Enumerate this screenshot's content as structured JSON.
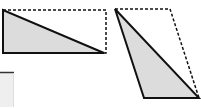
{
  "diagram": {
    "colors": {
      "fill": "#dcdcdc",
      "stroke": "#111111",
      "background": "#ffffff"
    },
    "figures": [
      {
        "name": "rectangle-with-triangle",
        "dashed_shape": "rectangle",
        "dashed_points": [
          [
            3,
            10
          ],
          [
            106,
            10
          ],
          [
            106,
            53
          ],
          [
            3,
            53
          ]
        ],
        "triangle_points": [
          [
            3,
            10
          ],
          [
            3,
            53
          ],
          [
            104,
            53
          ]
        ]
      },
      {
        "name": "parallelogram-with-triangle",
        "dashed_shape": "parallelogram",
        "dashed_points": [
          [
            115,
            9
          ],
          [
            170,
            9
          ],
          [
            199,
            98
          ],
          [
            144,
            98
          ]
        ],
        "triangle_points": [
          [
            115,
            9
          ],
          [
            144,
            98
          ],
          [
            199,
            98
          ]
        ]
      }
    ],
    "fragment": {
      "name": "partial-grey-box",
      "x": 0,
      "y": 72,
      "width": 14,
      "height": 35
    }
  }
}
